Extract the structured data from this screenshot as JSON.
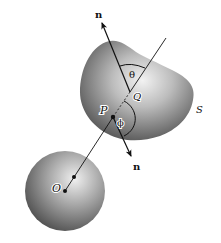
{
  "figure": {
    "labels": {
      "n_top": "n",
      "n_bottom": "n",
      "theta": "θ",
      "phi": "ϕ",
      "Q": "Q",
      "P": "P",
      "O": "O",
      "S": "S"
    },
    "colors": {
      "line": "#111111",
      "body_dark": "#3a3a3a",
      "body_light": "#e8e8e8",
      "background": "#ffffff"
    }
  }
}
